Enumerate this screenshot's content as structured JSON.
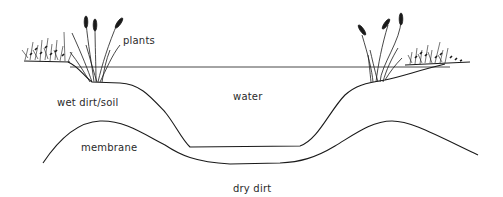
{
  "diagram": {
    "labels": {
      "plants": "plants",
      "water": "water",
      "wet_soil": "wet dirt/soil",
      "membrane": "membrane",
      "dry_dirt": "dry dirt"
    },
    "colors": {
      "line": "#1a1a1a",
      "background": "#ffffff"
    }
  }
}
